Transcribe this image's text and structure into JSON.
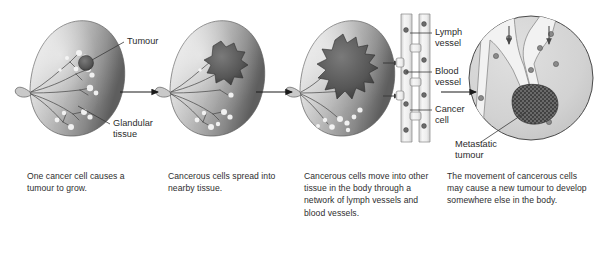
{
  "figure": {
    "panel_count": 4,
    "palette": {
      "breast_light": "#e8e8e8",
      "breast_mid": "#b9b9b9",
      "breast_dark": "#6f6f6f",
      "breast_edge": "#4a4a4a",
      "tumour_fill": "#5c5c5c",
      "tumour_dark": "#3f3f3f",
      "gland_line": "#4d4d4d",
      "gland_highlight": "#f4f4f4",
      "vessel_fill": "#f0f0f0",
      "vessel_stroke": "#8f8f8f",
      "cancer_cell": "#6b6b6b",
      "inset_fill": "#d4d4d4",
      "inset_stroke": "#4a4a4a",
      "arrow": "#1a1a1a",
      "leader": "#3a3a3a",
      "text": "#2b2b2b",
      "background": "#ffffff"
    }
  },
  "panels": [
    {
      "id": "panel-1",
      "step": 1,
      "scene": "breast-with-small-tumour",
      "labels": [
        {
          "name": "tumour",
          "text": "Tumour"
        },
        {
          "name": "glandular-tissue",
          "text": "Glandular\ntissue",
          "line1": "Glandular",
          "line2": "tissue"
        }
      ],
      "caption": "One cancer cell causes a tumour to grow."
    },
    {
      "id": "panel-2",
      "step": 2,
      "scene": "breast-with-spreading-tumour",
      "labels": [],
      "caption": "Cancerous cells spread into nearby tissue."
    },
    {
      "id": "panel-3",
      "step": 3,
      "scene": "breast-with-vessels",
      "labels": [
        {
          "name": "lymph-vessel",
          "line1": "Lymph",
          "line2": "vessel",
          "text": "Lymph vessel"
        },
        {
          "name": "blood-vessel",
          "line1": "Blood",
          "line2": "vessel",
          "text": "Blood vessel"
        },
        {
          "name": "cancer-cell",
          "line1": "Cancer",
          "line2": "cell",
          "text": "Cancer cell"
        }
      ],
      "caption": "Cancerous cells move into other tissue in the body through a network of lymph vessels and blood vessels."
    },
    {
      "id": "panel-4",
      "step": 4,
      "scene": "vessel-inset-with-metastasis",
      "labels": [
        {
          "name": "metastatic-tumour",
          "line1": "Metastatic",
          "line2": "tumour",
          "text": "Metastatic tumour"
        }
      ],
      "caption": "The movement of cancerous cells may cause a new tumour to develop somewhere else in the body."
    }
  ],
  "arrows": [
    {
      "name": "arrow-step-1-to-2",
      "from_panel": 1,
      "to_panel": 2
    },
    {
      "name": "arrow-step-2-to-3",
      "from_panel": 2,
      "to_panel": 3
    },
    {
      "name": "arrow-step-3-to-4",
      "from_panel": 3,
      "to_panel": 4
    }
  ],
  "inset_arrows": [
    {
      "name": "inset-entry-arrow-left"
    },
    {
      "name": "inset-entry-arrow-right"
    }
  ]
}
